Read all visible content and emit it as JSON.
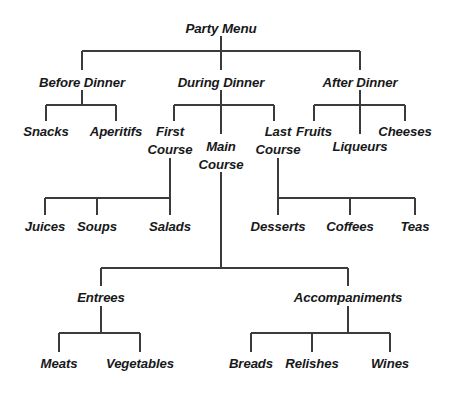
{
  "diagram": {
    "title": "Party Menu",
    "type": "hierarchy-tree",
    "orientation": "top-down",
    "line_color": "#3b3b3b",
    "text_color": "#17181a",
    "background_color": "#ffffff",
    "nodes": {
      "root": "Party Menu",
      "before_dinner": "Before Dinner",
      "during_dinner": "During Dinner",
      "after_dinner": "After Dinner",
      "snacks": "Snacks",
      "aperitifs": "Aperitifs",
      "first_course_l1": "First",
      "first_course_l2": "Course",
      "main_course_l1": "Main",
      "main_course_l2": "Course",
      "last_course_l1": "Last",
      "last_course_l2": "Course",
      "fruits": "Fruits",
      "liqueurs": "Liqueurs",
      "cheeses": "Cheeses",
      "juices": "Juices",
      "soups": "Soups",
      "salads": "Salads",
      "desserts": "Desserts",
      "coffees": "Coffees",
      "teas": "Teas",
      "entrees": "Entrees",
      "accompaniments": "Accompaniments",
      "meats": "Meats",
      "vegetables": "Vegetables",
      "breads": "Breads",
      "relishes": "Relishes",
      "wines": "Wines"
    },
    "tree": {
      "name": "Party Menu",
      "children": [
        {
          "name": "Before Dinner",
          "children": [
            {
              "name": "Snacks",
              "children": []
            },
            {
              "name": "Aperitifs",
              "children": []
            }
          ]
        },
        {
          "name": "During Dinner",
          "children": [
            {
              "name": "First Course",
              "children": [
                {
                  "name": "Juices",
                  "children": []
                },
                {
                  "name": "Soups",
                  "children": []
                },
                {
                  "name": "Salads",
                  "children": []
                }
              ]
            },
            {
              "name": "Main Course",
              "children": [
                {
                  "name": "Entrees",
                  "children": [
                    {
                      "name": "Meats",
                      "children": []
                    },
                    {
                      "name": "Vegetables",
                      "children": []
                    }
                  ]
                },
                {
                  "name": "Accompaniments",
                  "children": [
                    {
                      "name": "Breads",
                      "children": []
                    },
                    {
                      "name": "Relishes",
                      "children": []
                    },
                    {
                      "name": "Wines",
                      "children": []
                    }
                  ]
                }
              ]
            },
            {
              "name": "Last Course",
              "children": [
                {
                  "name": "Desserts",
                  "children": []
                },
                {
                  "name": "Coffees",
                  "children": []
                },
                {
                  "name": "Teas",
                  "children": []
                }
              ]
            }
          ]
        },
        {
          "name": "After Dinner",
          "children": [
            {
              "name": "Fruits",
              "children": []
            },
            {
              "name": "Liqueurs",
              "children": []
            },
            {
              "name": "Cheeses",
              "children": []
            }
          ]
        }
      ]
    }
  }
}
